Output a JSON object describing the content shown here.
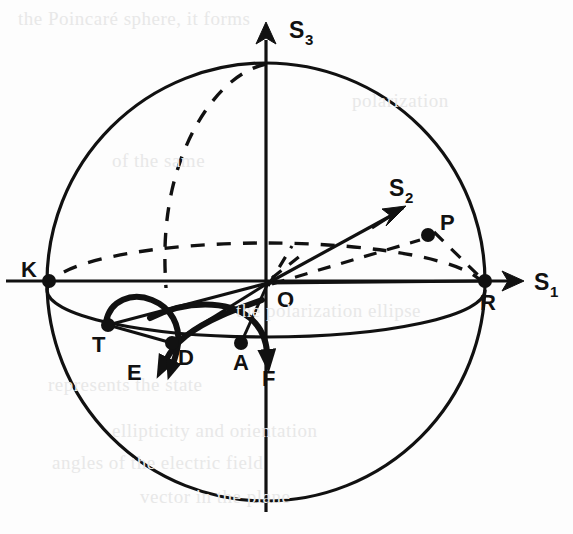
{
  "figure": {
    "kind": "poincare-sphere-diagram",
    "background_color": "#fdfdfd",
    "stroke_color": "#111111",
    "bleed_through_color": "#e8e8e8"
  },
  "axes": [
    {
      "name": "s3-axis",
      "label": "S",
      "subscript": "3",
      "direction": "up",
      "label_x": 289,
      "label_y": 38,
      "sub_x": 305,
      "sub_y": 45
    },
    {
      "name": "s1-axis",
      "label": "S",
      "subscript": "1",
      "direction": "right",
      "label_x": 534,
      "label_y": 290,
      "sub_x": 550,
      "sub_y": 297
    },
    {
      "name": "s2-axis",
      "label": "S",
      "subscript": "2",
      "direction": "up-right-oblique",
      "label_x": 389,
      "label_y": 196,
      "sub_x": 405,
      "sub_y": 203
    }
  ],
  "points": [
    {
      "name": "point-o",
      "label": "O",
      "x": 270,
      "y": 281,
      "label_x": 277,
      "label_y": 307,
      "dot": false
    },
    {
      "name": "point-k",
      "label": "K",
      "x": 49,
      "y": 281,
      "label_x": 21,
      "label_y": 277,
      "dot": true
    },
    {
      "name": "point-r",
      "label": "R",
      "x": 485,
      "y": 281,
      "label_x": 480,
      "label_y": 310,
      "dot": true
    },
    {
      "name": "point-p",
      "label": "P",
      "x": 428,
      "y": 235,
      "label_x": 440,
      "label_y": 230,
      "dot": true
    },
    {
      "name": "point-t",
      "label": "T",
      "x": 108,
      "y": 325,
      "label_x": 92,
      "label_y": 352,
      "dot": true
    },
    {
      "name": "point-d",
      "label": "D",
      "x": 172,
      "y": 343,
      "label_x": 178,
      "label_y": 365,
      "dot": true
    },
    {
      "name": "point-a",
      "label": "A",
      "x": 241,
      "y": 343,
      "label_x": 233,
      "label_y": 370,
      "dot": true
    },
    {
      "name": "point-e",
      "label": "E",
      "x": 160,
      "y": 367,
      "label_x": 127,
      "label_y": 380,
      "dot": false
    },
    {
      "name": "point-f",
      "label": "F",
      "x": 268,
      "y": 360,
      "label_x": 262,
      "label_y": 386,
      "dot": false
    }
  ],
  "geometry": {
    "sphere": {
      "cx": 266,
      "cy": 282,
      "rx": 219,
      "ry": 219
    },
    "equator_ellipse": {
      "cx": 266,
      "cy": 290,
      "rx": 219,
      "ry": 47
    },
    "vertical_axis": {
      "x": 266,
      "y_top": 24,
      "y_bottom": 512
    },
    "horizontal_axis": {
      "y": 281,
      "x_left": 6,
      "x_right": 523
    }
  },
  "bleed_text": [
    {
      "text": "the Poincaré sphere, it forms",
      "x": 18,
      "y": 8
    },
    {
      "text": "polarization",
      "x": 352,
      "y": 90
    },
    {
      "text": "of the same",
      "x": 112,
      "y": 150
    },
    {
      "text": "the polarization ellipse",
      "x": 236,
      "y": 300
    },
    {
      "text": "represents the state",
      "x": 48,
      "y": 374
    },
    {
      "text": "ellipticity and orientation",
      "x": 112,
      "y": 420
    },
    {
      "text": "angles of the electric field",
      "x": 52,
      "y": 452
    },
    {
      "text": "vector in the plane",
      "x": 140,
      "y": 486
    }
  ]
}
